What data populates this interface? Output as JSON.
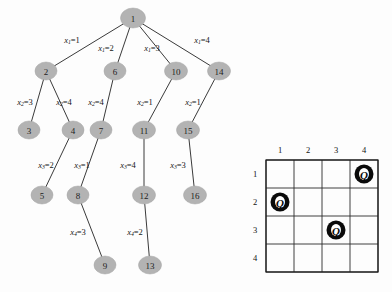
{
  "figure": {
    "type": "state-space-search-tree-with-chessboard",
    "background_color": "#fdfdfd",
    "node_fill": "#b3b3b3",
    "edge_color": "#3a3a3a"
  },
  "tree": {
    "title": "",
    "nodes": [
      {
        "id": "1",
        "label": "1",
        "x": 133,
        "y": 18,
        "rx": 12.5,
        "ry": 10
      },
      {
        "id": "2",
        "label": "2",
        "x": 46,
        "y": 71,
        "rx": 11,
        "ry": 9
      },
      {
        "id": "6",
        "label": "6",
        "x": 115,
        "y": 71,
        "rx": 11,
        "ry": 9
      },
      {
        "id": "10",
        "label": "10",
        "x": 176,
        "y": 71,
        "rx": 11.5,
        "ry": 9
      },
      {
        "id": "14",
        "label": "14",
        "x": 219,
        "y": 71,
        "rx": 11.5,
        "ry": 9
      },
      {
        "id": "3",
        "label": "3",
        "x": 29,
        "y": 130,
        "rx": 11,
        "ry": 9
      },
      {
        "id": "4",
        "label": "4",
        "x": 73,
        "y": 130,
        "rx": 11,
        "ry": 9
      },
      {
        "id": "7",
        "label": "7",
        "x": 101,
        "y": 130,
        "rx": 11,
        "ry": 9
      },
      {
        "id": "11",
        "label": "11",
        "x": 144,
        "y": 130,
        "rx": 11.5,
        "ry": 9
      },
      {
        "id": "15",
        "label": "15",
        "x": 188,
        "y": 130,
        "rx": 11.5,
        "ry": 9
      },
      {
        "id": "5",
        "label": "5",
        "x": 42,
        "y": 195,
        "rx": 11,
        "ry": 9
      },
      {
        "id": "8",
        "label": "8",
        "x": 78,
        "y": 195,
        "rx": 11,
        "ry": 9
      },
      {
        "id": "12",
        "label": "12",
        "x": 144,
        "y": 195,
        "rx": 11.5,
        "ry": 9
      },
      {
        "id": "16",
        "label": "16",
        "x": 195,
        "y": 195,
        "rx": 11.5,
        "ry": 9
      },
      {
        "id": "9",
        "label": "9",
        "x": 105,
        "y": 265,
        "rx": 11,
        "ry": 9
      },
      {
        "id": "13",
        "label": "13",
        "x": 150,
        "y": 265,
        "rx": 11.5,
        "ry": 9
      }
    ],
    "edges": [
      {
        "from": "1",
        "to": "2",
        "variable": "x",
        "subscript": "1",
        "value": "1",
        "label_x": 72,
        "label_y": 40
      },
      {
        "from": "1",
        "to": "6",
        "variable": "x",
        "subscript": "1",
        "value": "2",
        "label_x": 106,
        "label_y": 48
      },
      {
        "from": "1",
        "to": "10",
        "variable": "x",
        "subscript": "1",
        "value": "3",
        "label_x": 152,
        "label_y": 48
      },
      {
        "from": "1",
        "to": "14",
        "variable": "x",
        "subscript": "1",
        "value": "4",
        "label_x": 202,
        "label_y": 40
      },
      {
        "from": "2",
        "to": "3",
        "variable": "x",
        "subscript": "2",
        "value": "3",
        "label_x": 25,
        "label_y": 102
      },
      {
        "from": "2",
        "to": "4",
        "variable": "x",
        "subscript": "2",
        "value": "4",
        "label_x": 64,
        "label_y": 102
      },
      {
        "from": "6",
        "to": "7",
        "variable": "x",
        "subscript": "2",
        "value": "4",
        "label_x": 96,
        "label_y": 102
      },
      {
        "from": "10",
        "to": "11",
        "variable": "x",
        "subscript": "2",
        "value": "1",
        "label_x": 145,
        "label_y": 102
      },
      {
        "from": "14",
        "to": "15",
        "variable": "x",
        "subscript": "2",
        "value": "1",
        "label_x": 193,
        "label_y": 102
      },
      {
        "from": "4",
        "to": "5",
        "variable": "x",
        "subscript": "3",
        "value": "2",
        "label_x": 46,
        "label_y": 165
      },
      {
        "from": "7",
        "to": "8",
        "variable": "x",
        "subscript": "3",
        "value": "1",
        "label_x": 82,
        "label_y": 165
      },
      {
        "from": "11",
        "to": "12",
        "variable": "x",
        "subscript": "3",
        "value": "4",
        "label_x": 128,
        "label_y": 165
      },
      {
        "from": "15",
        "to": "16",
        "variable": "x",
        "subscript": "3",
        "value": "3",
        "label_x": 178,
        "label_y": 165
      },
      {
        "from": "8",
        "to": "9",
        "variable": "x",
        "subscript": "4",
        "value": "3",
        "label_x": 78,
        "label_y": 232
      },
      {
        "from": "12",
        "to": "13",
        "variable": "x",
        "subscript": "4",
        "value": "2",
        "label_x": 135,
        "label_y": 232
      }
    ]
  },
  "chessboard": {
    "size": 4,
    "origin_x": 266,
    "origin_y": 160,
    "cell": 28,
    "column_headers": [
      "1",
      "2",
      "3",
      "4"
    ],
    "row_headers": [
      "1",
      "2",
      "3",
      "4"
    ],
    "queen_glyph": "Q",
    "queens": [
      {
        "row": 1,
        "col": 4
      },
      {
        "row": 2,
        "col": 1
      },
      {
        "row": 3,
        "col": 3
      }
    ]
  }
}
